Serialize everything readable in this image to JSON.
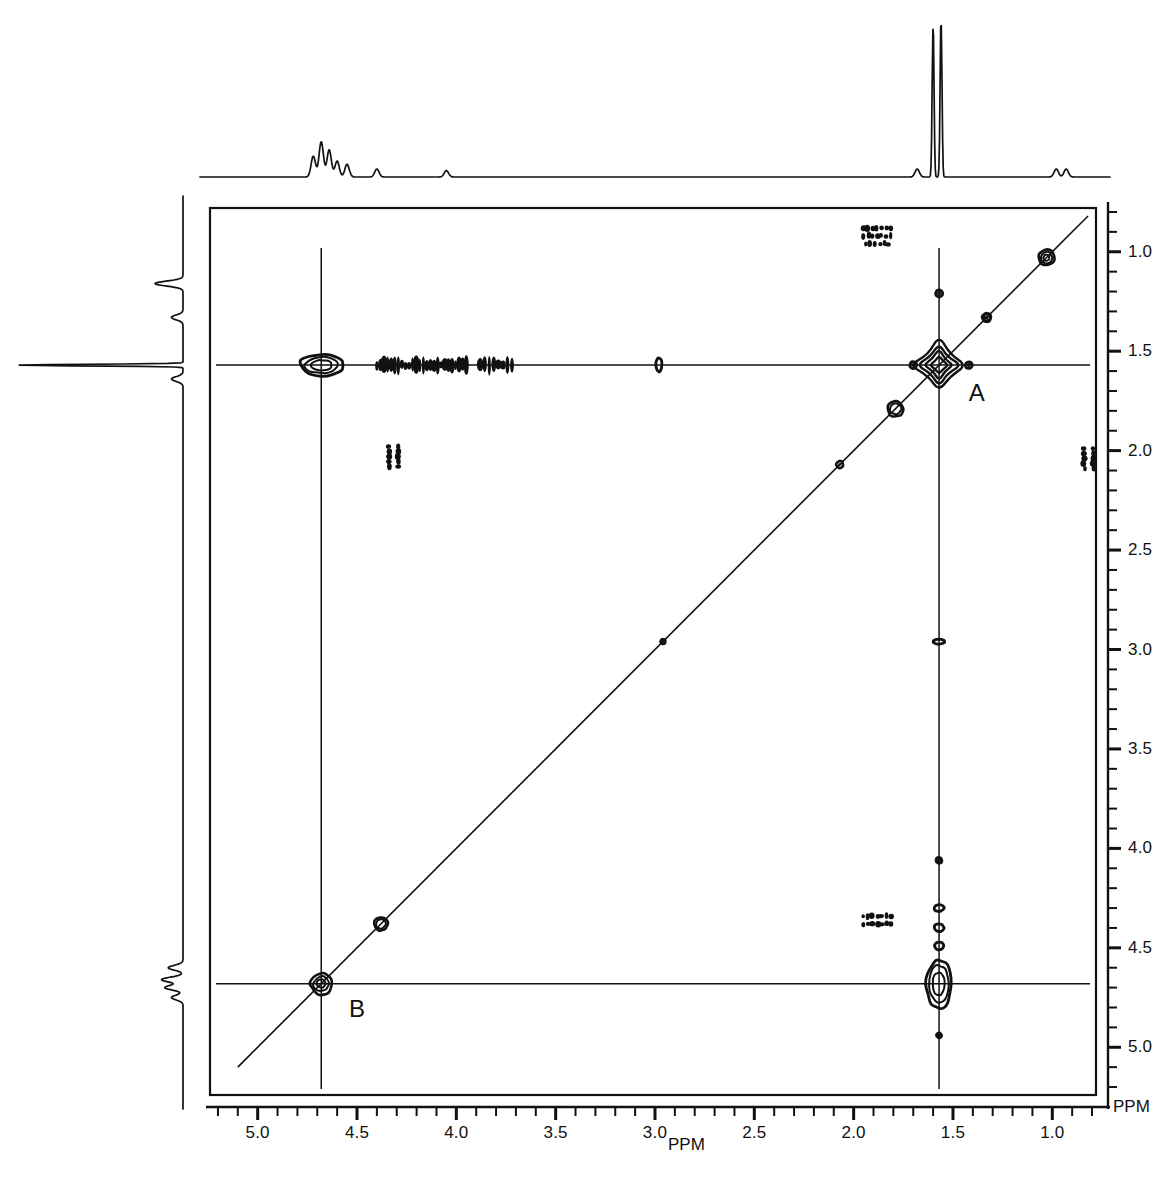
{
  "figure": {
    "type": "2d-nmr-cosy-contour",
    "background": "#ffffff",
    "ink": "#111111",
    "x_unit_label": "PPM",
    "y_unit_label": "PPM"
  },
  "axes": {
    "x": {
      "label": "PPM",
      "orientation": "reversed",
      "min_ppm": 0.78,
      "max_ppm": 5.24,
      "major_ticks": [
        5.0,
        4.5,
        4.0,
        3.5,
        3.0,
        2.5,
        2.0,
        1.5,
        1.0
      ],
      "major_tick_labels": [
        "5.0",
        "4.5",
        "4.0",
        "3.5",
        "3.0",
        "2.5",
        "2.0",
        "1.5",
        "1.0"
      ],
      "minor_tick_step": 0.1,
      "pixel_left": 210,
      "pixel_right": 1096,
      "ppm_at_left": 5.24,
      "ppm_at_right": 0.78
    },
    "y": {
      "label": "PPM",
      "orientation": "reversed",
      "min_ppm": 0.78,
      "max_ppm": 5.24,
      "major_ticks": [
        1.0,
        1.5,
        2.0,
        2.5,
        3.0,
        3.5,
        4.0,
        4.5,
        5.0
      ],
      "major_tick_labels": [
        "1.0",
        "1.5",
        "2.0",
        "2.5",
        "3.0",
        "3.5",
        "4.0",
        "4.5",
        "5.0"
      ],
      "minor_tick_step": 0.1,
      "pixel_top": 208,
      "pixel_bottom": 1095,
      "ppm_at_top": 0.78,
      "ppm_at_bottom": 5.24
    }
  },
  "annotations": [
    {
      "text": "A",
      "ppm_x": 1.42,
      "ppm_y": 1.72,
      "note": "diagonal peak A"
    },
    {
      "text": "B",
      "ppm_x": 4.54,
      "ppm_y": 4.82,
      "note": "diagonal peak B"
    }
  ],
  "cursor_lines": {
    "vertical_ppm": [
      1.57,
      4.68
    ],
    "horizontal_ppm": [
      1.57,
      4.68
    ]
  },
  "chart_data": {
    "type": "scatter",
    "title": "",
    "xlabel": "PPM",
    "ylabel": "PPM",
    "xlim": [
      5.24,
      0.78
    ],
    "ylim": [
      5.24,
      0.78
    ],
    "grid": false,
    "legend": "none",
    "diagonal_line": true,
    "diagonal_peaks": [
      {
        "ppm": 1.03,
        "size": 16,
        "rings": 3,
        "label": ""
      },
      {
        "ppm": 1.33,
        "size": 9,
        "rings": 2,
        "label": ""
      },
      {
        "ppm": 1.57,
        "size": 50,
        "rings": 4,
        "label": "A"
      },
      {
        "ppm": 1.79,
        "size": 16,
        "rings": 2,
        "label": ""
      },
      {
        "ppm": 2.07,
        "size": 7,
        "rings": 1,
        "label": ""
      },
      {
        "ppm": 2.96,
        "size": 5,
        "rings": 1,
        "label": ""
      },
      {
        "ppm": 4.38,
        "size": 14,
        "rings": 2,
        "label": ""
      },
      {
        "ppm": 4.68,
        "size": 22,
        "rings": 3,
        "label": "B"
      }
    ],
    "cross_peaks": [
      {
        "ppm_x": 4.68,
        "ppm_y": 1.57,
        "size_x": 44,
        "size_y": 22,
        "rings": 3
      },
      {
        "ppm_x": 1.57,
        "ppm_y": 4.68,
        "size_x": 26,
        "size_y": 50,
        "rings": 3
      },
      {
        "ppm_x": 2.98,
        "ppm_y": 1.57,
        "size_x": 6,
        "size_y": 14,
        "rings": 1
      },
      {
        "ppm_x": 1.57,
        "ppm_y": 2.96,
        "size_x": 12,
        "size_y": 5,
        "rings": 1
      },
      {
        "ppm_x": 1.57,
        "ppm_y": 4.06,
        "size_x": 6,
        "size_y": 6,
        "rings": 1
      },
      {
        "ppm_x": 1.57,
        "ppm_y": 4.3,
        "size_x": 10,
        "size_y": 7,
        "rings": 1
      },
      {
        "ppm_x": 1.57,
        "ppm_y": 4.4,
        "size_x": 10,
        "size_y": 8,
        "rings": 1
      },
      {
        "ppm_x": 1.57,
        "ppm_y": 4.49,
        "size_x": 9,
        "size_y": 8,
        "rings": 1
      },
      {
        "ppm_x": 1.57,
        "ppm_y": 4.94,
        "size_x": 5,
        "size_y": 5,
        "rings": 1
      },
      {
        "ppm_x": 1.57,
        "ppm_y": 1.21,
        "size_x": 7,
        "size_y": 7,
        "rings": 1
      },
      {
        "ppm_x": 1.42,
        "ppm_y": 1.57,
        "size_x": 7,
        "size_y": 7,
        "rings": 1
      },
      {
        "ppm_x": 1.7,
        "ppm_y": 1.57,
        "size_x": 7,
        "size_y": 7,
        "rings": 1
      }
    ],
    "noise_ridges": [
      {
        "ppm_y": 1.57,
        "from_ppm_x": 4.4,
        "to_ppm_x": 3.95,
        "density": 26
      },
      {
        "ppm_y": 1.57,
        "from_ppm_x": 3.88,
        "to_ppm_x": 3.72,
        "density": 8
      }
    ],
    "artifact_clusters": [
      {
        "ppm_x": 1.87,
        "ppm_y": 0.88,
        "rows": 2,
        "dots": 7
      },
      {
        "ppm_x": 1.87,
        "ppm_y": 0.96,
        "rows": 1,
        "dots": 6
      },
      {
        "ppm_x": 1.87,
        "ppm_y": 4.34,
        "rows": 2,
        "dots": 7
      },
      {
        "ppm_x": 4.34,
        "ppm_y": 2.01,
        "rows": 3,
        "dots": 6
      },
      {
        "ppm_x": 0.84,
        "ppm_y": 2.02,
        "rows": 3,
        "dots": 6
      }
    ],
    "projection_top": {
      "description": "1D proton spectrum projection along F2",
      "baseline_ppm_range": [
        5.24,
        0.78
      ],
      "peaks": [
        {
          "ppm": 4.72,
          "height": 0.13
        },
        {
          "ppm": 4.68,
          "height": 0.22
        },
        {
          "ppm": 4.64,
          "height": 0.17
        },
        {
          "ppm": 4.6,
          "height": 0.1
        },
        {
          "ppm": 4.55,
          "height": 0.08
        },
        {
          "ppm": 4.4,
          "height": 0.05
        },
        {
          "ppm": 4.05,
          "height": 0.04
        },
        {
          "ppm": 1.6,
          "height": 0.96
        },
        {
          "ppm": 1.56,
          "height": 1.0
        },
        {
          "ppm": 1.68,
          "height": 0.05
        },
        {
          "ppm": 0.98,
          "height": 0.05
        },
        {
          "ppm": 0.93,
          "height": 0.05
        }
      ]
    },
    "projection_left": {
      "description": "1D proton spectrum projection along F1",
      "baseline_ppm_range": [
        0.78,
        5.24
      ],
      "peaks": [
        {
          "ppm": 1.16,
          "height": 0.17
        },
        {
          "ppm": 1.33,
          "height": 0.07
        },
        {
          "ppm": 1.57,
          "height": 1.0
        },
        {
          "ppm": 1.64,
          "height": 0.07
        },
        {
          "ppm": 4.6,
          "height": 0.09
        },
        {
          "ppm": 4.66,
          "height": 0.13
        },
        {
          "ppm": 4.7,
          "height": 0.11
        },
        {
          "ppm": 4.75,
          "height": 0.07
        }
      ]
    }
  }
}
